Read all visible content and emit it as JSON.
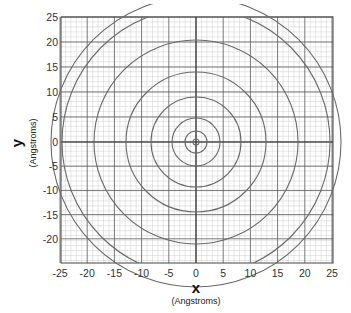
{
  "chart_data": {
    "type": "scatter",
    "subtype": "concentric-circles-on-grid",
    "title": "",
    "xlabel": "x",
    "xlabel_unit": "(Angstroms)",
    "ylabel": "y",
    "ylabel_unit": "(Angstroms)",
    "xlim": [
      -25,
      25
    ],
    "ylim": [
      -25,
      25
    ],
    "x_ticks": [
      -25,
      -20,
      -15,
      -10,
      -5,
      0,
      5,
      10,
      15,
      20,
      25
    ],
    "y_ticks": [
      25,
      20,
      15,
      10,
      5,
      0,
      -5,
      -10,
      -15,
      -20
    ],
    "grid": {
      "major_every": 5,
      "minor_every": 1,
      "on": true
    },
    "center": [
      0,
      0
    ],
    "circles_approx_radius_units": [
      0.5,
      2,
      4.5,
      8.5,
      13,
      18.5,
      24.5,
      27
    ]
  },
  "colors": {
    "circle": "#6a6a6a",
    "major_grid": "#555555",
    "minor_grid": "#c8c8c8",
    "background": "#ffffff"
  }
}
